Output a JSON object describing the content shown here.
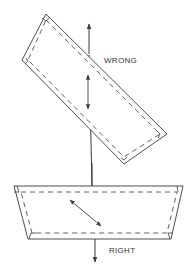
{
  "diagram": {
    "type": "technical-illustration",
    "colors": {
      "line": "#3a3a3a",
      "background": "#ffffff"
    },
    "labels": {
      "wrong": "WRONG",
      "right": "RIGHT"
    },
    "panels": [
      {
        "id": "wrong",
        "label": "WRONG",
        "shape": "rotated rectangle with dashed inner seam line and corner marks",
        "arrows": [
          "vertical arrow above pointing up",
          "vertical double arrow inside"
        ]
      },
      {
        "id": "right",
        "label": "RIGHT",
        "shape": "trapezoid with dashed inner seam line and corner marks",
        "arrows": [
          "diagonal double arrow inside",
          "vertical arrow below pointing down"
        ]
      }
    ],
    "connector": "vertical line joining the two pieces"
  }
}
